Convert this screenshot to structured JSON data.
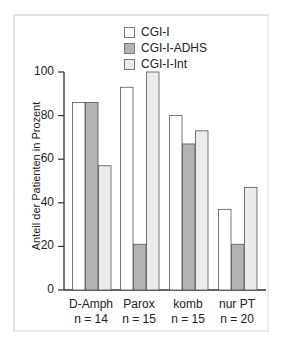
{
  "chart_data": {
    "type": "bar",
    "title": "",
    "xlabel": "",
    "ylabel": "Anteil der Patienten in Prozent",
    "ylim": [
      0,
      100
    ],
    "yticks": [
      0,
      20,
      40,
      60,
      80,
      100
    ],
    "grid": false,
    "legend_position": "top",
    "categories": [
      "D-Amph",
      "Parox",
      "komb",
      "nur PT"
    ],
    "category_n": [
      "n = 14",
      "n = 15",
      "n = 15",
      "n = 20"
    ],
    "series": [
      {
        "name": "CGI-I",
        "color": "#ffffff",
        "values": [
          86,
          93,
          80,
          37
        ]
      },
      {
        "name": "CGI-I-ADHS",
        "color": "#b3b3b3",
        "values": [
          86,
          21,
          67,
          21
        ]
      },
      {
        "name": "CGI-I-Int",
        "color": "#ebebeb",
        "values": [
          57,
          100,
          73,
          47
        ]
      }
    ]
  },
  "legend": {
    "items": [
      {
        "label": "CGI-I",
        "color": "#ffffff"
      },
      {
        "label": "CGI-I-ADHS",
        "color": "#b3b3b3"
      },
      {
        "label": "CGI-I-Int",
        "color": "#ebebeb"
      }
    ]
  },
  "axis": {
    "ylabel": "Anteil der Patienten in Prozent",
    "yticks": [
      "0",
      "20",
      "40",
      "60",
      "80",
      "100"
    ]
  },
  "xlabels": [
    {
      "name": "D-Amph",
      "n": "n = 14"
    },
    {
      "name": "Parox",
      "n": "n = 15"
    },
    {
      "name": "komb",
      "n": "n = 15"
    },
    {
      "name": "nur PT",
      "n": "n = 20"
    }
  ]
}
